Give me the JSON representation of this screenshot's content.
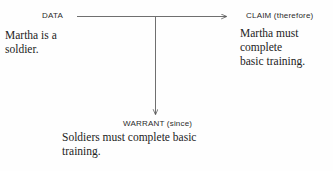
{
  "diagram": {
    "type": "toulmin-argument-model",
    "background_color": "#fefefe",
    "line_color": "#4a4a4a",
    "text_color": "#232323",
    "nodes": {
      "data": {
        "label": "DATA",
        "body": "Martha is a\nsoldier."
      },
      "claim": {
        "label": "CLAIM (therefore)",
        "body": "Martha must\ncomplete\nbasic training."
      },
      "warrant": {
        "label": "WARRANT (since)",
        "body": "Soldiers must complete basic\ntraining."
      }
    },
    "connectors": [
      {
        "name": "data-to-claim-arrow",
        "from": "data",
        "to": "claim",
        "direction": "right"
      },
      {
        "name": "data-to-warrant-arrow",
        "from": "data",
        "to": "warrant",
        "direction": "down"
      }
    ]
  }
}
